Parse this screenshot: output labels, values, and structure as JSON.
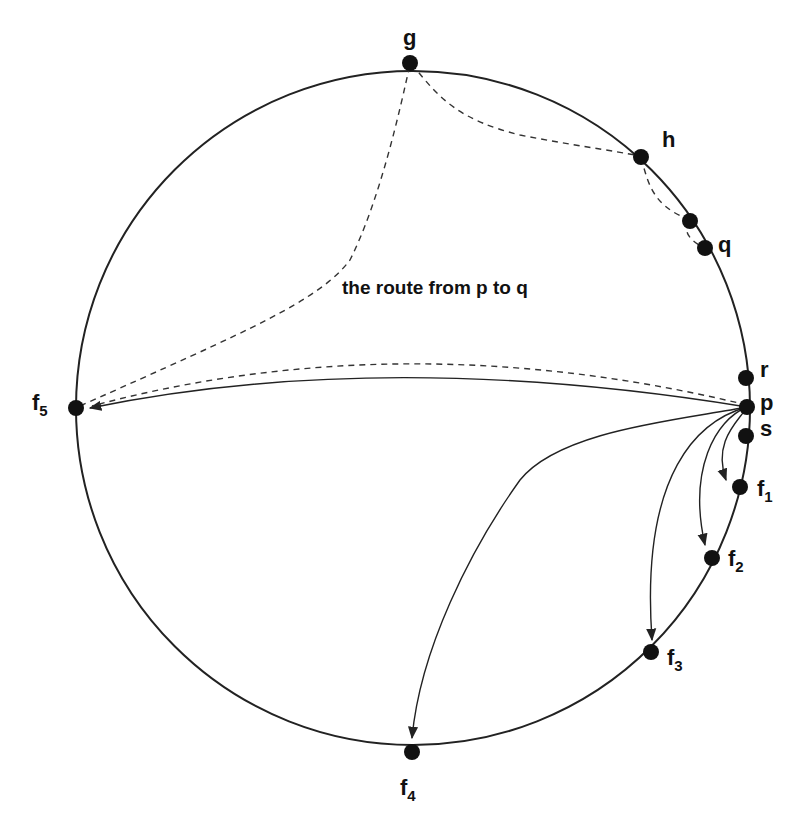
{
  "diagram": {
    "type": "ring routing diagram",
    "caption": "the route from p to q",
    "nodes": [
      {
        "id": "g",
        "label": "g",
        "sub": ""
      },
      {
        "id": "h",
        "label": "h",
        "sub": ""
      },
      {
        "id": "mid",
        "label": "",
        "sub": ""
      },
      {
        "id": "q",
        "label": "q",
        "sub": ""
      },
      {
        "id": "r",
        "label": "r",
        "sub": ""
      },
      {
        "id": "p",
        "label": "p",
        "sub": ""
      },
      {
        "id": "s",
        "label": "s",
        "sub": ""
      },
      {
        "id": "f1",
        "label": "f",
        "sub": "1"
      },
      {
        "id": "f2",
        "label": "f",
        "sub": "2"
      },
      {
        "id": "f3",
        "label": "f",
        "sub": "3"
      },
      {
        "id": "f4",
        "label": "f",
        "sub": "4"
      },
      {
        "id": "f5",
        "label": "f",
        "sub": "5"
      }
    ],
    "solid_edges": [
      {
        "from": "p",
        "to": "f1"
      },
      {
        "from": "p",
        "to": "f2"
      },
      {
        "from": "p",
        "to": "f3"
      },
      {
        "from": "p",
        "to": "f4"
      },
      {
        "from": "p",
        "to": "f5"
      }
    ],
    "dashed_route": [
      "p",
      "f5",
      "g",
      "h",
      "mid",
      "q"
    ]
  }
}
